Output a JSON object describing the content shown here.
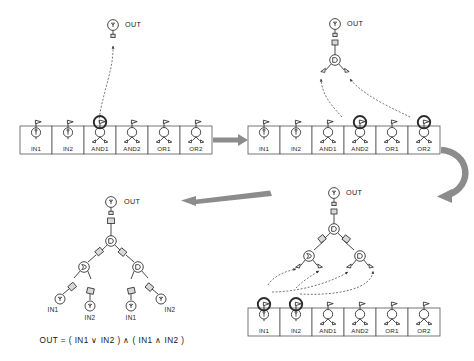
{
  "figure": {
    "background_color": "#ffffff",
    "ink_color": "#2b2b2b",
    "arrow_color": "#8c8c8c",
    "highlight_color": "#2b2b2b"
  },
  "palette": {
    "name": "component-palette",
    "cells": [
      {
        "id": "IN1",
        "label": "IN1",
        "kind": "input"
      },
      {
        "id": "IN2",
        "label": "IN2",
        "kind": "input"
      },
      {
        "id": "AND1",
        "label": "AND1",
        "kind": "and"
      },
      {
        "id": "AND2",
        "label": "AND2",
        "kind": "and"
      },
      {
        "id": "OR1",
        "label": "OR1",
        "kind": "or"
      },
      {
        "id": "OR2",
        "label": "OR2",
        "kind": "or"
      }
    ]
  },
  "panels": [
    {
      "id": "panel-1",
      "position": "top-left",
      "out_label": "OUT",
      "highlighted_cells": [
        "AND1"
      ],
      "canvas_nodes": [],
      "drag_links": [
        {
          "from": "AND1",
          "to": "OUT"
        }
      ]
    },
    {
      "id": "panel-2",
      "position": "top-right",
      "out_label": "OUT",
      "highlighted_cells": [
        "AND2",
        "OR2"
      ],
      "canvas_nodes": [
        {
          "id": "root",
          "kind": "and",
          "label": "AND1"
        }
      ],
      "drag_links": [
        {
          "from": "AND2",
          "to": "root-left-port"
        },
        {
          "from": "OR2",
          "to": "root-right-port"
        }
      ]
    },
    {
      "id": "panel-3",
      "position": "bottom-right",
      "out_label": "OUT",
      "highlighted_cells": [
        "IN1",
        "IN2"
      ],
      "canvas_nodes": [
        {
          "id": "root",
          "kind": "and",
          "label": "AND1"
        },
        {
          "id": "left",
          "kind": "or",
          "label": "OR2"
        },
        {
          "id": "right",
          "kind": "and",
          "label": "AND2"
        }
      ],
      "drag_links": [
        {
          "from": "IN1",
          "to": "left-left-port"
        },
        {
          "from": "IN2",
          "to": "left-right-port"
        },
        {
          "from": "IN1",
          "to": "right-left-port"
        },
        {
          "from": "IN2",
          "to": "right-right-port"
        }
      ]
    },
    {
      "id": "panel-4",
      "position": "bottom-left",
      "out_label": "OUT",
      "highlighted_cells": [],
      "canvas_nodes": [
        {
          "id": "root",
          "kind": "and",
          "label": "AND1"
        },
        {
          "id": "left",
          "kind": "or",
          "label": "OR2"
        },
        {
          "id": "right",
          "kind": "and",
          "label": "AND2"
        }
      ],
      "leaf_labels": [
        "IN1",
        "IN2",
        "IN1",
        "IN2"
      ],
      "formula": "OUT = ( IN1 ∨ IN2 ) ∧ ( IN1 ∧ IN2 )"
    }
  ],
  "flow_arrows": [
    {
      "id": "arrow-right",
      "direction": "right",
      "from_panel": "panel-1",
      "to_panel": "panel-2"
    },
    {
      "id": "arrow-u-turn",
      "direction": "u-turn",
      "from_panel": "panel-2",
      "to_panel": "panel-3"
    },
    {
      "id": "arrow-left",
      "direction": "left",
      "from_panel": "panel-3",
      "to_panel": "panel-4"
    }
  ]
}
